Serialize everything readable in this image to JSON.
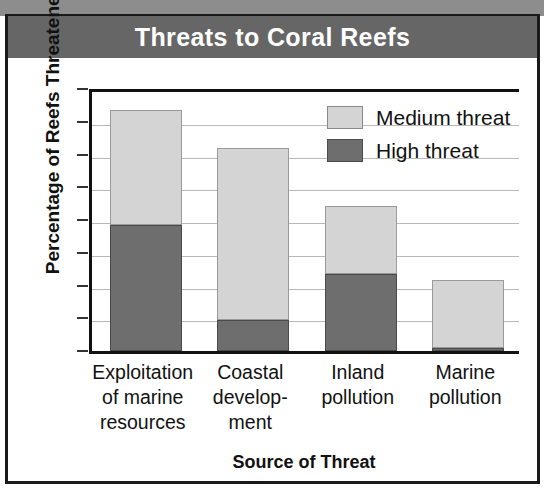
{
  "chart_data": {
    "type": "bar",
    "stacked": true,
    "title": "Threats to Coral Reefs",
    "xlabel": "Source of Threat",
    "ylabel": "Percentage of Reefs Threatened",
    "categories": [
      "Exploitation\nof marine\nresources",
      "Coastal\ndevelop-\nment",
      "Inland\npollution",
      "Marine\npollution"
    ],
    "category_lines": [
      [
        "Exploitation",
        "of marine",
        "resources"
      ],
      [
        "Coastal",
        "develop-",
        "ment"
      ],
      [
        "Inland",
        "pollution"
      ],
      [
        "Marine",
        "pollution"
      ]
    ],
    "series": [
      {
        "name": "High threat",
        "values": [
          19.3,
          4.7,
          11.7,
          0.5
        ],
        "color": "#6e6e6e"
      },
      {
        "name": "Medium threat",
        "values": [
          17.5,
          26.3,
          10.5,
          10.3
        ],
        "color": "#d4d4d4"
      }
    ],
    "totals": [
      36.8,
      31.0,
      22.2,
      10.8
    ],
    "ylim": [
      0,
      40
    ],
    "yticks": [
      0,
      5,
      10,
      15,
      20,
      25,
      30,
      35,
      40
    ],
    "ytick_labels": [
      "0",
      "5",
      "10",
      "15",
      "20",
      "25",
      "30",
      "35",
      "40"
    ],
    "grid": true,
    "legend_position": "top-right",
    "legend": [
      "Medium threat",
      "High threat"
    ]
  },
  "legend_items": [
    {
      "label": "Medium threat",
      "swatch": "medium"
    },
    {
      "label": "High threat",
      "swatch": "high"
    }
  ],
  "colors": {
    "title_banner": "#666666",
    "high_threat": "#6e6e6e",
    "medium_threat": "#d4d4d4",
    "frame": "#1a1a1a",
    "gridline": "#b8b8b8"
  }
}
